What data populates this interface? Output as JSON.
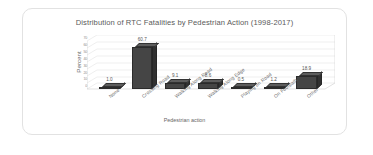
{
  "chart_data": {
    "type": "bar",
    "title": "Distribution of RTC Fatalities  by Pedestrian Action (1998-2017)",
    "xlabel": "Pedestrian action",
    "ylabel": "Percent",
    "categories": [
      "None",
      "Crossing Road",
      "Walking Along Road",
      "Walking Along Edge",
      "Playing on Road",
      "On Footpath",
      "Other"
    ],
    "values": [
      1.0,
      60.7,
      9.1,
      8.6,
      0.5,
      1.2,
      18.9
    ],
    "data_labels": [
      "1.0",
      "60.7",
      "9.1",
      "8.6",
      "0.5",
      "1.2",
      "18.9"
    ],
    "ytick_labels": [
      "70",
      "60",
      "50",
      "40",
      "30",
      "20",
      "10",
      "0"
    ],
    "ylim": [
      0,
      70
    ],
    "grid": true,
    "legend": "none",
    "bar_color": "#454545",
    "three_d": true
  },
  "figure": {
    "caption": ""
  }
}
